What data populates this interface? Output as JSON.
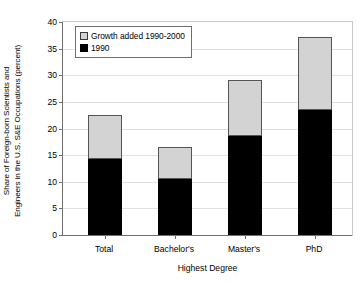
{
  "chart_data": {
    "type": "bar",
    "title": "",
    "subtitle": "",
    "xlabel": "Highest Degree",
    "ylabel": "Share of Foreign-born Scientists and\nEngineers in the U.S. S&E Occupations (percent)",
    "categories": [
      "Total",
      "Bachelor's",
      "Master's",
      "PhD"
    ],
    "series": [
      {
        "name": "1990",
        "values": [
          14.2,
          10.5,
          18.5,
          23.4
        ]
      },
      {
        "name": "Growth added 1990-2000",
        "values": [
          8.2,
          5.9,
          10.5,
          13.6
        ]
      }
    ],
    "totals": [
      22.4,
      16.4,
      29.0,
      37.0
    ],
    "stacked": true,
    "ylim": [
      0,
      40
    ],
    "yticks": [
      0,
      5,
      10,
      15,
      20,
      25,
      30,
      35,
      40
    ],
    "ytick_labels": [
      "0",
      "5",
      "10",
      "15",
      "20",
      "25",
      "30",
      "35",
      "40"
    ],
    "grid": true,
    "legend_position": "top-left",
    "legend": [
      "Growth added 1990-2000",
      "1990"
    ],
    "colors": {
      "growth": "#d3d3d3",
      "base": "#000000",
      "axis": "#6f6f6f",
      "grid": "#e2e2e2",
      "background": "#ffffff"
    }
  }
}
